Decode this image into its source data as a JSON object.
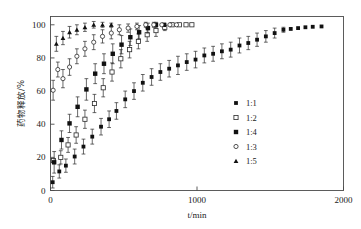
{
  "chart_data": {
    "type": "scatter",
    "title": "",
    "xlabel": "t/min",
    "ylabel": "药物释放/%",
    "xlim": [
      0,
      2000
    ],
    "ylim": [
      0,
      105
    ],
    "xticks": [
      0,
      1000,
      2000
    ],
    "xtick_labels": [
      "0",
      "1000",
      "2000"
    ],
    "yticks": [
      0,
      20,
      40,
      60,
      80,
      100
    ],
    "ytick_labels": [
      "0",
      "20",
      "40",
      "60",
      "80",
      "100"
    ],
    "grid": false,
    "legend_position": "center-right",
    "error_bars": true,
    "series": [
      {
        "name": "1:1",
        "marker": "filled-square",
        "points": [
          {
            "x": 15,
            "y": 5,
            "err": 3.5
          },
          {
            "x": 60,
            "y": 11.5,
            "err": 4.0
          },
          {
            "x": 105,
            "y": 15,
            "err": 4.0
          },
          {
            "x": 165,
            "y": 20.5,
            "err": 4.5
          },
          {
            "x": 225,
            "y": 26.5,
            "err": 4.5
          },
          {
            "x": 285,
            "y": 32.5,
            "err": 4.5
          },
          {
            "x": 345,
            "y": 38.5,
            "err": 5.0
          },
          {
            "x": 400,
            "y": 43,
            "err": 5.0
          },
          {
            "x": 450,
            "y": 48,
            "err": 5.0
          },
          {
            "x": 510,
            "y": 55,
            "err": 5.0
          },
          {
            "x": 570,
            "y": 60,
            "err": 5.0
          },
          {
            "x": 630,
            "y": 65,
            "err": 5.0
          },
          {
            "x": 690,
            "y": 68.5,
            "err": 5.0
          },
          {
            "x": 750,
            "y": 71.5,
            "err": 5.0
          },
          {
            "x": 810,
            "y": 73.5,
            "err": 5.0
          },
          {
            "x": 870,
            "y": 75.5,
            "err": 5.5
          },
          {
            "x": 930,
            "y": 77.5,
            "err": 5.0
          },
          {
            "x": 990,
            "y": 79,
            "err": 5.0
          },
          {
            "x": 1050,
            "y": 81.5,
            "err": 4.5
          },
          {
            "x": 1110,
            "y": 82.5,
            "err": 4.5
          },
          {
            "x": 1170,
            "y": 84,
            "err": 4.5
          },
          {
            "x": 1230,
            "y": 85,
            "err": 4.5
          },
          {
            "x": 1290,
            "y": 87.5,
            "err": 4.5
          },
          {
            "x": 1350,
            "y": 89,
            "err": 4.0
          },
          {
            "x": 1410,
            "y": 91,
            "err": 4.0
          },
          {
            "x": 1470,
            "y": 93,
            "err": 3.5
          },
          {
            "x": 1530,
            "y": 95,
            "err": 3.0
          },
          {
            "x": 1590,
            "y": 97,
            "err": 1.5
          },
          {
            "x": 1640,
            "y": 97.5,
            "err": 0
          },
          {
            "x": 1690,
            "y": 98,
            "err": 0
          },
          {
            "x": 1740,
            "y": 98.5,
            "err": 0
          },
          {
            "x": 1790,
            "y": 98.8,
            "err": 0
          },
          {
            "x": 1850,
            "y": 99,
            "err": 0
          }
        ]
      },
      {
        "name": "1:2",
        "marker": "open-square",
        "points": [
          {
            "x": 20,
            "y": 18,
            "err": 0
          },
          {
            "x": 70,
            "y": 20,
            "err": 4.0
          },
          {
            "x": 120,
            "y": 27.5,
            "err": 4.5
          },
          {
            "x": 175,
            "y": 33.5,
            "err": 5.0
          },
          {
            "x": 235,
            "y": 43,
            "err": 5.5
          },
          {
            "x": 300,
            "y": 52.5,
            "err": 5.5
          },
          {
            "x": 360,
            "y": 62,
            "err": 5.5
          },
          {
            "x": 420,
            "y": 71.5,
            "err": 5.5
          },
          {
            "x": 480,
            "y": 79.5,
            "err": 5.5
          },
          {
            "x": 540,
            "y": 85,
            "err": 5.0
          },
          {
            "x": 600,
            "y": 90,
            "err": 4.5
          },
          {
            "x": 660,
            "y": 94,
            "err": 4.0
          },
          {
            "x": 720,
            "y": 96.5,
            "err": 3.5
          },
          {
            "x": 780,
            "y": 98.5,
            "err": 2.0
          },
          {
            "x": 830,
            "y": 100,
            "err": 0
          },
          {
            "x": 880,
            "y": 100,
            "err": 0
          },
          {
            "x": 925,
            "y": 100,
            "err": 0
          },
          {
            "x": 965,
            "y": 100,
            "err": 0
          }
        ]
      },
      {
        "name": "1:4",
        "marker": "filled-square",
        "points": [
          {
            "x": 25,
            "y": 17,
            "err": 6.5
          },
          {
            "x": 75,
            "y": 30.5,
            "err": 5.5
          },
          {
            "x": 130,
            "y": 40.5,
            "err": 5.5
          },
          {
            "x": 185,
            "y": 50.5,
            "err": 6.0
          },
          {
            "x": 245,
            "y": 61,
            "err": 6.5
          },
          {
            "x": 305,
            "y": 70.5,
            "err": 6.0
          },
          {
            "x": 365,
            "y": 76.5,
            "err": 6.0
          },
          {
            "x": 425,
            "y": 82.5,
            "err": 6.0
          },
          {
            "x": 485,
            "y": 88,
            "err": 5.5
          },
          {
            "x": 545,
            "y": 92.5,
            "err": 5.0
          },
          {
            "x": 605,
            "y": 95.5,
            "err": 4.0
          },
          {
            "x": 665,
            "y": 98,
            "err": 3.0
          },
          {
            "x": 720,
            "y": 100,
            "err": 1.5
          },
          {
            "x": 775,
            "y": 100,
            "err": 0
          }
        ]
      },
      {
        "name": "1:3",
        "marker": "open-circle",
        "points": [
          {
            "x": 18,
            "y": 60.5,
            "err": 6.0
          },
          {
            "x": 50,
            "y": 73,
            "err": 4.5
          },
          {
            "x": 85,
            "y": 67.5,
            "err": 5.5
          },
          {
            "x": 130,
            "y": 74.5,
            "err": 5.0
          },
          {
            "x": 180,
            "y": 81,
            "err": 4.5
          },
          {
            "x": 235,
            "y": 85.5,
            "err": 4.5
          },
          {
            "x": 295,
            "y": 89.5,
            "err": 4.5
          },
          {
            "x": 355,
            "y": 93,
            "err": 4.0
          },
          {
            "x": 415,
            "y": 95,
            "err": 3.5
          },
          {
            "x": 470,
            "y": 97,
            "err": 3.0
          },
          {
            "x": 530,
            "y": 98,
            "err": 2.5
          },
          {
            "x": 590,
            "y": 99,
            "err": 2.0
          },
          {
            "x": 650,
            "y": 100,
            "err": 1.5
          },
          {
            "x": 705,
            "y": 100,
            "err": 1.5
          },
          {
            "x": 760,
            "y": 100,
            "err": 0
          },
          {
            "x": 815,
            "y": 100,
            "err": 0
          },
          {
            "x": 860,
            "y": 100,
            "err": 0
          }
        ]
      },
      {
        "name": "1:5",
        "marker": "filled-triangle",
        "points": [
          {
            "x": 40,
            "y": 88.5,
            "err": 4.5
          },
          {
            "x": 85,
            "y": 92,
            "err": 4.0
          },
          {
            "x": 130,
            "y": 95.5,
            "err": 3.5
          },
          {
            "x": 180,
            "y": 97,
            "err": 3.0
          },
          {
            "x": 235,
            "y": 98.5,
            "err": 2.5
          },
          {
            "x": 295,
            "y": 100,
            "err": 2.0
          },
          {
            "x": 355,
            "y": 100,
            "err": 1.5
          },
          {
            "x": 415,
            "y": 100,
            "err": 1.0
          }
        ]
      }
    ],
    "legend": [
      {
        "label": "1:1",
        "marker": "filled-square"
      },
      {
        "label": "1:2",
        "marker": "open-square"
      },
      {
        "label": "1:4",
        "marker": "filled-square"
      },
      {
        "label": "1:3",
        "marker": "open-circle"
      },
      {
        "label": "1:5",
        "marker": "filled-triangle"
      }
    ]
  }
}
